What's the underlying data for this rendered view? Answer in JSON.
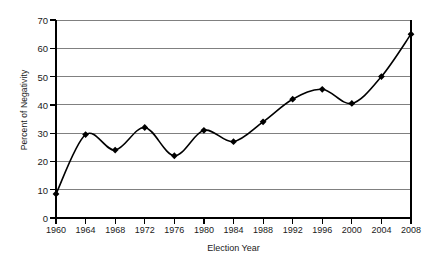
{
  "chart_data": {
    "type": "line",
    "title": "",
    "xlabel": "Election Year",
    "ylabel": "Percent of Negativity",
    "x": [
      1960,
      1964,
      1968,
      1972,
      1976,
      1980,
      1984,
      1988,
      1992,
      1996,
      2000,
      2004,
      2008
    ],
    "values": [
      8.5,
      29.5,
      24,
      32,
      22,
      31,
      27,
      34,
      42,
      45.5,
      40.5,
      50,
      65
    ],
    "categories": [
      "1960",
      "1964",
      "1968",
      "1972",
      "1976",
      "1980",
      "1984",
      "1988",
      "1992",
      "1996",
      "2000",
      "2004",
      "2008"
    ],
    "xlim": [
      1960,
      2008
    ],
    "ylim": [
      0,
      70
    ],
    "yticks": [
      "0",
      "10",
      "20",
      "30",
      "40",
      "50",
      "60",
      "70"
    ],
    "ytick_values": [
      0,
      10,
      20,
      30,
      40,
      50,
      60,
      70
    ],
    "xticks": [
      "1960",
      "1964",
      "1968",
      "1972",
      "1976",
      "1980",
      "1984",
      "1988",
      "1992",
      "1996",
      "2000",
      "2004",
      "2008"
    ],
    "grid": "horizontal",
    "legend": "none",
    "marker": "filled-diamond",
    "line_color": "#000000",
    "grid_color": "#808080",
    "axis_color": "#000000",
    "background": "#ffffff"
  }
}
